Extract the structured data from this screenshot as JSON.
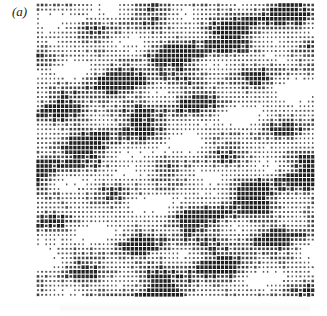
{
  "figure": {
    "panel_label": "(a)"
  },
  "dot_grid": {
    "x0": 38,
    "y0": 5,
    "x1": 316,
    "y1": 298,
    "pitch_x": 4.1,
    "pitch_y": 4.6,
    "dot_color": "#1e1e1e",
    "seed": 7
  }
}
